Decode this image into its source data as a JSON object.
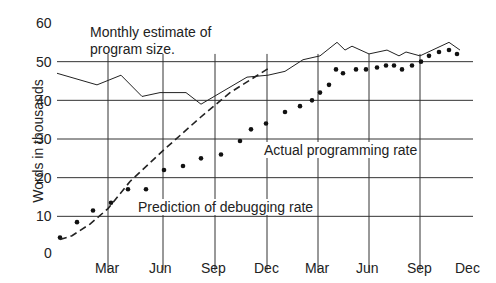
{
  "chart_data": {
    "type": "line",
    "title": "",
    "xlabel": "",
    "ylabel": "Words in thousands",
    "ylim": [
      0,
      60
    ],
    "yticks": [
      0,
      10,
      20,
      30,
      40,
      50,
      60
    ],
    "xticks": [
      "Mar",
      "Jun",
      "Sep",
      "Dec",
      "Mar",
      "Jun",
      "Sep",
      "Dec"
    ],
    "grid": true,
    "annotations": [
      "Monthly estimate of program size.",
      "Actual programming rate",
      "Prediction of debugging rate"
    ],
    "series": [
      {
        "name": "Monthly estimate of program size",
        "style": "solid-line",
        "points": [
          [
            57,
            47
          ],
          [
            97,
            44
          ],
          [
            121,
            46.5
          ],
          [
            142,
            41
          ],
          [
            160,
            42
          ],
          [
            186,
            42
          ],
          [
            201,
            39
          ],
          [
            247,
            46
          ],
          [
            268,
            46.5
          ],
          [
            285,
            47.5
          ],
          [
            303,
            50.5
          ],
          [
            320,
            51.5
          ],
          [
            337,
            55
          ],
          [
            345,
            53
          ],
          [
            352,
            54
          ],
          [
            369,
            52
          ],
          [
            387,
            53
          ],
          [
            399,
            51.5
          ],
          [
            406,
            52.5
          ],
          [
            420,
            51.5
          ],
          [
            449,
            55
          ],
          [
            460,
            53
          ]
        ]
      },
      {
        "name": "Actual programming rate",
        "style": "dots",
        "points": [
          [
            60,
            4.5
          ],
          [
            77,
            8.5
          ],
          [
            93,
            11.5
          ],
          [
            111,
            13.5
          ],
          [
            128,
            17
          ],
          [
            146,
            17
          ],
          [
            164,
            22
          ],
          [
            183,
            23
          ],
          [
            201,
            25
          ],
          [
            221,
            26
          ],
          [
            240,
            29.5
          ],
          [
            251,
            32.5
          ],
          [
            266,
            34
          ],
          [
            285,
            37
          ],
          [
            300,
            38.5
          ],
          [
            312,
            40
          ],
          [
            320,
            42
          ],
          [
            329,
            44
          ],
          [
            336,
            48
          ],
          [
            343,
            47
          ],
          [
            356,
            48
          ],
          [
            366,
            48
          ],
          [
            377,
            48.5
          ],
          [
            386,
            49
          ],
          [
            394,
            49
          ],
          [
            402,
            48
          ],
          [
            412,
            49
          ],
          [
            421,
            50
          ],
          [
            429,
            51.5
          ],
          [
            439,
            52.5
          ],
          [
            449,
            53
          ],
          [
            457,
            52
          ]
        ]
      },
      {
        "name": "Prediction of debugging rate",
        "style": "dashed-line",
        "points": [
          [
            60,
            4
          ],
          [
            72,
            5
          ],
          [
            90,
            8
          ],
          [
            108,
            12
          ],
          [
            130,
            19
          ],
          [
            163,
            27
          ],
          [
            200,
            35.5
          ],
          [
            230,
            42
          ],
          [
            270,
            48.5
          ]
        ]
      }
    ],
    "axis_pixels": {
      "x_left": 57,
      "x_right": 473,
      "y0_px": 255,
      "y60_px": 23,
      "month_lines_x": [
        108,
        163,
        215,
        267,
        318,
        369,
        420
      ]
    }
  },
  "labels": {
    "ylabel": "Words in thousands",
    "estimate": "Monthly estimate of",
    "estimate2": "program size.",
    "actual": "Actual programming rate",
    "prediction": "Prediction of debugging rate"
  },
  "yticks": [
    "60",
    "50",
    "40",
    "30",
    "20",
    "10",
    "0"
  ],
  "xticks": [
    "Mar",
    "Jun",
    "Sep",
    "Dec",
    "Mar",
    "Jun",
    "Sep",
    "Dec"
  ]
}
